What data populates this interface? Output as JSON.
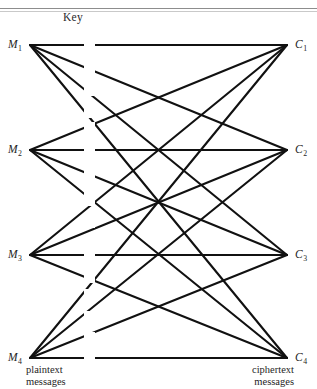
{
  "figure": {
    "key_title": "Key",
    "caption_left_line1": "plaintext",
    "caption_left_line2": "messages",
    "caption_right_line1": "ciphertext",
    "caption_right_line2": "messages",
    "ink_color": "#111111",
    "rule_color": "#8d8d8d"
  },
  "plaintext_nodes": [
    {
      "id": "M1",
      "base": "M",
      "sub": "1",
      "x": 22,
      "y": 45
    },
    {
      "id": "M2",
      "base": "M",
      "sub": "2",
      "x": 22,
      "y": 150
    },
    {
      "id": "M3",
      "base": "M",
      "sub": "3",
      "x": 22,
      "y": 255
    },
    {
      "id": "M4",
      "base": "M",
      "sub": "4",
      "x": 22,
      "y": 358
    }
  ],
  "ciphertext_nodes": [
    {
      "id": "C1",
      "base": "C",
      "sub": "1",
      "x": 295,
      "y": 45
    },
    {
      "id": "C2",
      "base": "C",
      "sub": "2",
      "x": 295,
      "y": 150
    },
    {
      "id": "C3",
      "base": "C",
      "sub": "3",
      "x": 295,
      "y": 255
    },
    {
      "id": "C4",
      "base": "C",
      "sub": "4",
      "x": 295,
      "y": 358
    }
  ],
  "key_labels": [
    {
      "text": "1",
      "x": 83,
      "y": 45
    },
    {
      "text": "2",
      "x": 83,
      "y": 68
    },
    {
      "text": "3",
      "x": 83,
      "y": 90
    },
    {
      "text": "4",
      "x": 83,
      "y": 112
    },
    {
      "text": "2",
      "x": 83,
      "y": 128
    },
    {
      "text": "3",
      "x": 83,
      "y": 150
    },
    {
      "text": "4",
      "x": 83,
      "y": 172
    },
    {
      "text": "1",
      "x": 83,
      "y": 194
    },
    {
      "text": "1",
      "x": 83,
      "y": 200
    },
    {
      "text": "3",
      "x": 83,
      "y": 222
    },
    {
      "text": "4",
      "x": 83,
      "y": 240
    },
    {
      "text": "1",
      "x": 83,
      "y": 255
    },
    {
      "text": "2",
      "x": 83,
      "y": 277
    },
    {
      "text": "4",
      "x": 83,
      "y": 295
    },
    {
      "text": "1",
      "x": 83,
      "y": 317
    },
    {
      "text": "2",
      "x": 83,
      "y": 338
    },
    {
      "text": "3",
      "x": 83,
      "y": 358
    }
  ],
  "edges": [
    {
      "from": "M1",
      "key": "1",
      "to": "C1",
      "x1": 30,
      "y1": 45,
      "x2": 287,
      "y2": 45
    },
    {
      "from": "M1",
      "key": "2",
      "to": "C2",
      "x1": 30,
      "y1": 45,
      "x2": 287,
      "y2": 150
    },
    {
      "from": "M1",
      "key": "3",
      "to": "C3",
      "x1": 30,
      "y1": 45,
      "x2": 287,
      "y2": 255
    },
    {
      "from": "M1",
      "key": "4",
      "to": "C4",
      "x1": 30,
      "y1": 45,
      "x2": 287,
      "y2": 358
    },
    {
      "from": "M2",
      "key": "2",
      "to": "C1",
      "x1": 30,
      "y1": 150,
      "x2": 287,
      "y2": 45
    },
    {
      "from": "M2",
      "key": "3",
      "to": "C2",
      "x1": 30,
      "y1": 150,
      "x2": 287,
      "y2": 150
    },
    {
      "from": "M2",
      "key": "4",
      "to": "C3",
      "x1": 30,
      "y1": 150,
      "x2": 287,
      "y2": 255
    },
    {
      "from": "M2",
      "key": "1",
      "to": "C4",
      "x1": 30,
      "y1": 150,
      "x2": 287,
      "y2": 358
    },
    {
      "from": "M3",
      "key": "3",
      "to": "C1",
      "x1": 30,
      "y1": 255,
      "x2": 287,
      "y2": 45
    },
    {
      "from": "M3",
      "key": "4",
      "to": "C2",
      "x1": 30,
      "y1": 255,
      "x2": 287,
      "y2": 150
    },
    {
      "from": "M3",
      "key": "1",
      "to": "C3",
      "x1": 30,
      "y1": 255,
      "x2": 287,
      "y2": 255
    },
    {
      "from": "M3",
      "key": "2",
      "to": "C4",
      "x1": 30,
      "y1": 255,
      "x2": 287,
      "y2": 358
    },
    {
      "from": "M4",
      "key": "4",
      "to": "C1",
      "x1": 30,
      "y1": 358,
      "x2": 287,
      "y2": 45
    },
    {
      "from": "M4",
      "key": "1",
      "to": "C2",
      "x1": 30,
      "y1": 358,
      "x2": 287,
      "y2": 150
    },
    {
      "from": "M4",
      "key": "2",
      "to": "C3",
      "x1": 30,
      "y1": 358,
      "x2": 287,
      "y2": 255
    },
    {
      "from": "M4",
      "key": "3",
      "to": "C4",
      "x1": 30,
      "y1": 358,
      "x2": 287,
      "y2": 358
    }
  ]
}
